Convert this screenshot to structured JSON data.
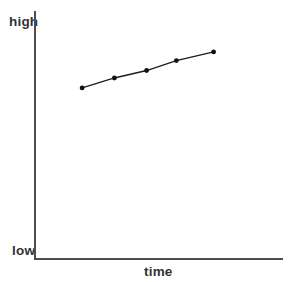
{
  "chart_data": {
    "type": "line",
    "title": "",
    "xlabel": "time",
    "ylabel": "",
    "ylabel_top": "high",
    "ylabel_bottom": "low",
    "x": [
      1,
      2,
      3,
      4,
      5
    ],
    "x_frac_along_time_axis": [
      0.19,
      0.32,
      0.45,
      0.57,
      0.72
    ],
    "values_norm_low_to_high": [
      0.69,
      0.73,
      0.76,
      0.8,
      0.835
    ],
    "y_range_labels": [
      "low",
      "high"
    ],
    "grid": false,
    "legend": false,
    "marker": "filled-circle",
    "line_color": "#1c1c1c",
    "point_color": "#111111",
    "axis_color": "#4d4d4d",
    "background_color": "#ffffff"
  }
}
